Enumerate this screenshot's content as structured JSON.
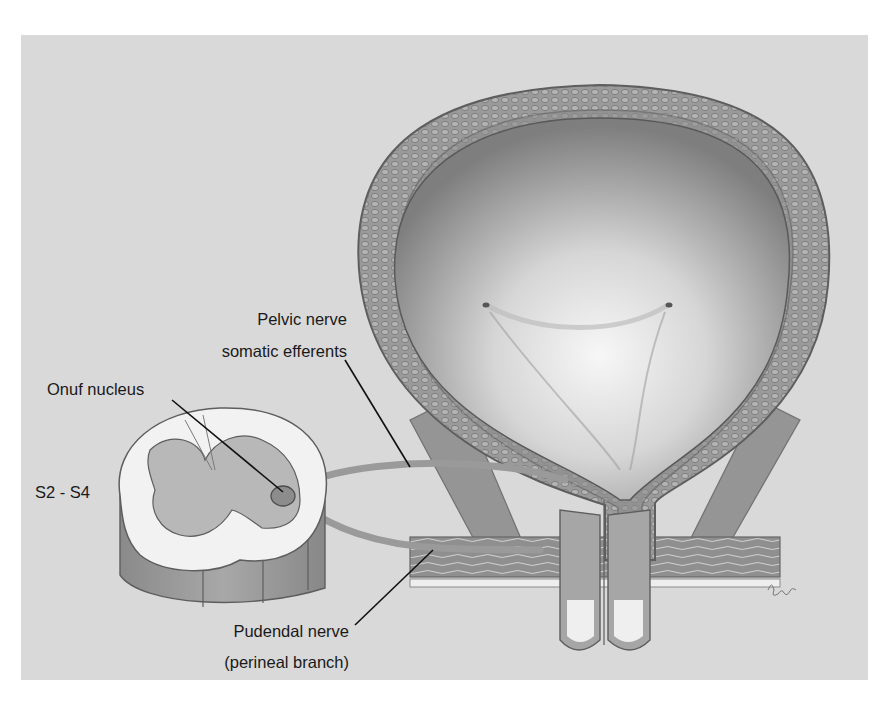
{
  "figure": {
    "colors": {
      "background_panel": "#d9d9d9",
      "bladder_wall": "#8c8c8c",
      "bladder_lumen_light": "#f4f4f4",
      "bladder_lumen_dark": "#8a8a8a",
      "nerve": "#9a9a9a",
      "spinal_white_matter": "#f2f2f2",
      "spinal_gray_matter": "#b8b8b8",
      "leader_line": "#111111"
    }
  },
  "labels": {
    "pelvic_nerve_line1": "Pelvic nerve",
    "pelvic_nerve_line2": "somatic efferents",
    "onuf_nucleus": "Onuf nucleus",
    "spinal_level": "S2 - S4",
    "pudendal_nerve_line1": "Pudendal nerve",
    "pudendal_nerve_line2": "(perineal branch)"
  },
  "structures": [
    {
      "name": "urinary-bladder"
    },
    {
      "name": "ureteral-orifices",
      "count": 2
    },
    {
      "name": "urethra"
    },
    {
      "name": "pelvic-floor-muscles"
    },
    {
      "name": "spinal-cord-segment"
    },
    {
      "name": "onuf-nucleus"
    },
    {
      "name": "pelvic-nerve"
    },
    {
      "name": "pudendal-nerve"
    }
  ]
}
